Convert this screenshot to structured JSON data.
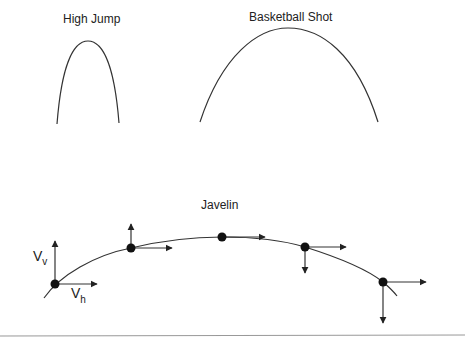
{
  "diagrams": {
    "high_jump": {
      "title": "High Jump"
    },
    "basketball": {
      "title": "Basketball Shot"
    },
    "javelin": {
      "title": "Javelin",
      "labels": {
        "vertical_velocity": "V",
        "vertical_sub": "v",
        "horizontal_velocity": "V",
        "horizontal_sub": "h"
      },
      "points": [
        {
          "x": 55,
          "y": 284,
          "up": 44,
          "down": 0,
          "right": 42
        },
        {
          "x": 131,
          "y": 248,
          "up": 24,
          "down": 0,
          "right": 41
        },
        {
          "x": 222,
          "y": 237,
          "up": 0,
          "down": 0,
          "right": 43
        },
        {
          "x": 305,
          "y": 247,
          "up": 0,
          "down": 26,
          "right": 41
        },
        {
          "x": 383,
          "y": 282,
          "up": 0,
          "down": 41,
          "right": 43
        }
      ]
    }
  },
  "colors": {
    "line": "#333333",
    "rule": "#999999"
  },
  "footer": {
    "caption": "…"
  }
}
